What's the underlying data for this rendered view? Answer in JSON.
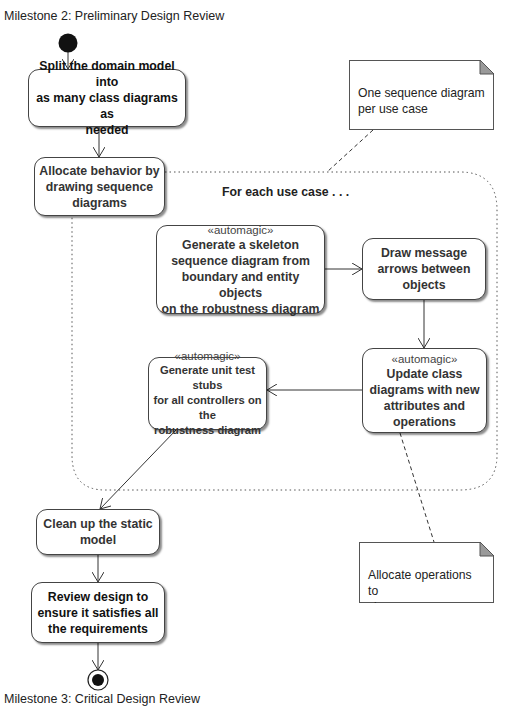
{
  "diagram": {
    "start_label": "Milestone 2: Preliminary Design Review",
    "end_label": "Milestone 3: Critical Design Review",
    "loop_region_label": "For each use case . . .",
    "activities": [
      {
        "id": "split-domain-model",
        "stereotype": "",
        "label": "Split the domain model into\nas many class diagrams as\nneeded"
      },
      {
        "id": "allocate-behavior",
        "stereotype": "",
        "label": "Allocate behavior by\ndrawing sequence\ndiagrams"
      },
      {
        "id": "generate-skeleton",
        "stereotype": "«automagic»",
        "label": "Generate a skeleton\nsequence diagram from\nboundary and entity objects\non the robustness diagram"
      },
      {
        "id": "draw-message-arrows",
        "stereotype": "",
        "label": "Draw message\narrows between\nobjects"
      },
      {
        "id": "update-class-diagrams",
        "stereotype": "«automagic»",
        "label": "Update class\ndiagrams with new\nattributes and\noperations"
      },
      {
        "id": "generate-unit-test-stubs",
        "stereotype": "«automagic»",
        "label": "Generate unit test stubs\nfor all controllers on the\nrobustness diagram"
      },
      {
        "id": "clean-up-static-model",
        "stereotype": "",
        "label": "Clean up the static\nmodel"
      },
      {
        "id": "review-design",
        "stereotype": "",
        "label": "Review design to\nensure it satisfies all\nthe requirements"
      }
    ],
    "notes": [
      {
        "id": "note-sequence-per-use-case",
        "text": "One sequence diagram\nper use case"
      },
      {
        "id": "note-allocate-operations",
        "text": "Allocate operations to\nclasses"
      }
    ],
    "colors": {
      "line": "#333333",
      "box_border": "#444444",
      "note_fold": "#9a9a9a",
      "start_node": "#111111"
    }
  }
}
